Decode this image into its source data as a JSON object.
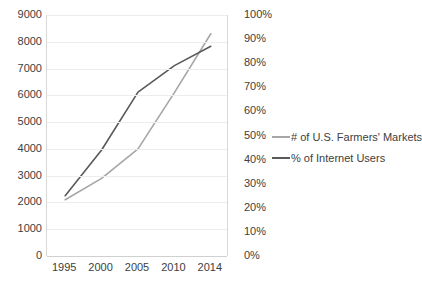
{
  "chart_data": {
    "type": "line",
    "title": "",
    "xlabel": "",
    "ylabel": "",
    "grid": true,
    "legend_position": "right",
    "x": [
      1995,
      2000,
      2005,
      2010,
      2014
    ],
    "x_tick_labels": [
      "1995",
      "2000",
      "2005",
      "2010",
      "2014"
    ],
    "axes": [
      {
        "id": "left",
        "side": "left",
        "ylim": [
          0,
          9000
        ],
        "tick_step": 1000,
        "tick_labels": [
          "9000",
          "8000",
          "7000",
          "6000",
          "5000",
          "4000",
          "3000",
          "2000",
          "1000",
          "0"
        ]
      },
      {
        "id": "right",
        "side": "right",
        "ylim": [
          0,
          100
        ],
        "tick_step": 10,
        "tick_labels": [
          "100%",
          "90%",
          "80%",
          "70%",
          "60%",
          "50%",
          "40%",
          "30%",
          "20%",
          "10%",
          "0%"
        ]
      }
    ],
    "series": [
      {
        "name": "# of U.S. Farmers' Markets",
        "axis": "left",
        "color": "#a6a6a6",
        "values": [
          2100,
          2900,
          4000,
          6100,
          8300
        ]
      },
      {
        "name": "% of Internet Users",
        "axis": "right",
        "color": "#595959",
        "values": [
          25,
          44,
          68,
          79,
          87
        ]
      }
    ]
  },
  "legend": {
    "items": [
      {
        "label": "# of U.S. Farmers' Markets",
        "color": "#a6a6a6"
      },
      {
        "label": "% of Internet Users",
        "color": "#595959"
      }
    ]
  },
  "colors": {
    "farmers_markets_line": "#a6a6a6",
    "internet_users_line": "#595959",
    "gridline": "#ededed",
    "axis": "#d9d9d9",
    "text": "#404040",
    "background": "#ffffff"
  }
}
